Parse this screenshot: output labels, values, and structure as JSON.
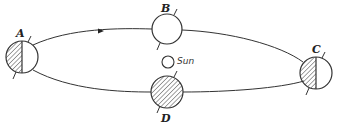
{
  "diagram": {
    "type": "orbit-diagram",
    "colors": {
      "line": "#333333",
      "hatch": "#555555",
      "background": "#ffffff"
    },
    "orbit": {
      "shape": "ellipse",
      "direction": "counterclockwise-as-drawn (arrow on top arc pointing right)",
      "arrow_icon": "arrowhead-right"
    },
    "sun": {
      "label": "Sun"
    },
    "positions": [
      {
        "id": "A",
        "label": "A",
        "shading": "left-half",
        "location": "left"
      },
      {
        "id": "B",
        "label": "B",
        "shading": "none",
        "location": "top"
      },
      {
        "id": "C",
        "label": "C",
        "shading": "left-half",
        "location": "right"
      },
      {
        "id": "D",
        "label": "D",
        "shading": "full",
        "location": "bottom"
      }
    ]
  }
}
